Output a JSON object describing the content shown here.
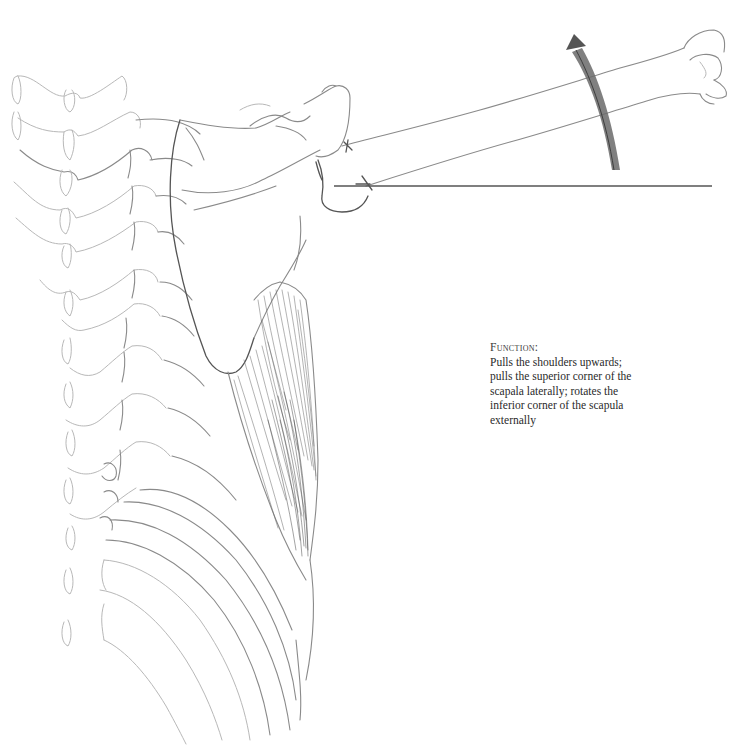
{
  "figure": {
    "elements": {
      "spine": "cervical and thoracic vertebrae drawn in light pencil on the left",
      "ribcage": "ribs curving down and to the right",
      "scapula": "shoulder blade outline",
      "humerus": "arm bone extending to the upper right",
      "muscle": "heavily shaded muscle fibers along the lateral ribcage",
      "reference_line": "horizontal reference line from shoulder to the right",
      "rotation_arrow": "curved shaded arrow near the humerus pointing upward"
    },
    "colors": {
      "background": "#ffffff",
      "pencil": "#8a8a8a",
      "pencil_dark": "#555555",
      "text": "#2a2a2a"
    }
  },
  "caption": {
    "heading": "Function:",
    "lines": [
      "Pulls the shoulders upwards;",
      "pulls the superior corner of the",
      "scapala laterally; rotates the",
      "inferior corner of the scapula",
      "externally"
    ]
  }
}
